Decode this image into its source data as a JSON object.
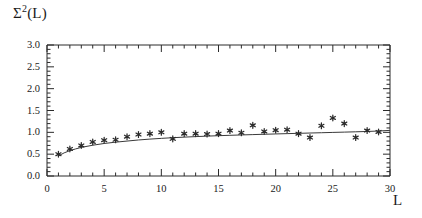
{
  "chart_data": {
    "type": "scatter",
    "title": "",
    "ylabel": "Σ²(L)",
    "ylabel_parts": {
      "base": "Σ",
      "exponent": "2",
      "arg": "(L)"
    },
    "xlabel": "L",
    "xlim": [
      0,
      30
    ],
    "ylim": [
      0.0,
      3.0
    ],
    "xticks": [
      0,
      5,
      10,
      15,
      20,
      25,
      30
    ],
    "xtick_labels": [
      "0",
      "5",
      "10",
      "15",
      "20",
      "25",
      "30"
    ],
    "xminor_step": 1,
    "yticks": [
      0.0,
      0.5,
      1.0,
      1.5,
      2.0,
      2.5,
      3.0
    ],
    "ytick_labels": [
      "0.0",
      "0.5",
      "1.0",
      "1.5",
      "2.0",
      "2.5",
      "3.0"
    ],
    "yminor_step": 0.1,
    "grid": false,
    "legend": null,
    "marker": "star",
    "marker_color": "#2b2b2b",
    "line_color": "#3a3a3a",
    "axis_color": "#2b2b2b",
    "series": [
      {
        "name": "data",
        "style": "scatter",
        "x": [
          1,
          2,
          3,
          4,
          5,
          6,
          7,
          8,
          9,
          10,
          11,
          12,
          13,
          14,
          15,
          16,
          17,
          18,
          19,
          20,
          21,
          22,
          23,
          24,
          25,
          26,
          27,
          28,
          29
        ],
        "y": [
          0.5,
          0.62,
          0.7,
          0.78,
          0.82,
          0.83,
          0.9,
          0.95,
          0.97,
          1.0,
          0.85,
          0.97,
          0.97,
          0.96,
          0.97,
          1.04,
          0.99,
          1.16,
          1.02,
          1.05,
          1.06,
          0.97,
          0.88,
          1.15,
          1.33,
          1.2,
          0.88,
          1.04,
          1.01
        ]
      },
      {
        "name": "theory-curve",
        "style": "line",
        "x": [
          1,
          1.5,
          2,
          2.5,
          3,
          4,
          5,
          6,
          7,
          8,
          9,
          10,
          11,
          12,
          13,
          14,
          15,
          16,
          17,
          18,
          19,
          20,
          21,
          22,
          23,
          24,
          25,
          26,
          27,
          28,
          29,
          30
        ],
        "y": [
          0.46,
          0.53,
          0.58,
          0.62,
          0.655,
          0.705,
          0.745,
          0.775,
          0.8,
          0.825,
          0.845,
          0.862,
          0.877,
          0.89,
          0.902,
          0.913,
          0.923,
          0.932,
          0.94,
          0.948,
          0.956,
          0.963,
          0.97,
          0.977,
          0.984,
          0.991,
          0.998,
          1.005,
          1.012,
          1.02,
          1.03,
          1.045
        ]
      }
    ]
  },
  "geometry": {
    "plot_left": 47,
    "plot_right": 390,
    "plot_top": 45,
    "plot_bottom": 176
  }
}
